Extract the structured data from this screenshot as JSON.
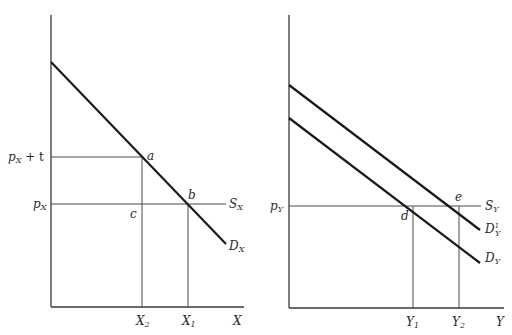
{
  "diagram": {
    "type": "economics-supply-demand",
    "panels": [
      {
        "id": "left",
        "axis_x_label": "X",
        "price_labels": {
          "tax_price": {
            "base": "p",
            "sub": "X",
            "suffix": " + t"
          },
          "price": {
            "base": "p",
            "sub": "X"
          }
        },
        "quantity_labels": {
          "q2": {
            "base": "X",
            "sub": "2"
          },
          "q1": {
            "base": "X",
            "sub": "1"
          }
        },
        "curve_labels": {
          "supply": {
            "base": "S",
            "sub": "X"
          },
          "demand": {
            "base": "D",
            "sub": "X"
          }
        },
        "points": {
          "a": "a",
          "b": "b",
          "c": "c"
        }
      },
      {
        "id": "right",
        "axis_x_label": "Y",
        "price_labels": {
          "price": {
            "base": "p",
            "sub": "Y"
          }
        },
        "quantity_labels": {
          "q1": {
            "base": "Y",
            "sub": "1"
          },
          "q2": {
            "base": "Y",
            "sub": "2"
          }
        },
        "curve_labels": {
          "supply": {
            "base": "S",
            "sub": "Y"
          },
          "demand_shifted": {
            "base": "D",
            "sub": "Y",
            "sup": "1"
          },
          "demand": {
            "base": "D",
            "sub": "Y"
          }
        },
        "points": {
          "d": "d",
          "e": "e"
        }
      }
    ]
  },
  "colors": {
    "curve": "#1a1a1a",
    "axis": "#3a3a3a",
    "guide": "#4a4a4a",
    "text": "#2a2a2a"
  }
}
